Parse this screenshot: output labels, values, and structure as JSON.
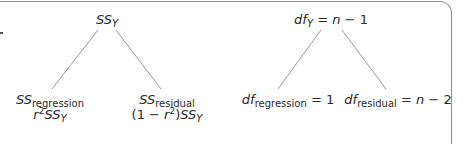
{
  "left_tree": {
    "root": {
      "var": "SS",
      "sub": "Y"
    },
    "left_child": {
      "var": "SS",
      "sub": "regression",
      "formula_prefix": "r",
      "formula_exp": "2",
      "formula_var": "SS",
      "formula_sub": "Y"
    },
    "right_child": {
      "var": "SS",
      "sub": "residual",
      "formula_open": "(1 − ",
      "formula_r": "r",
      "formula_exp": "2",
      "formula_close": ")",
      "formula_var": "SS",
      "formula_sub": "Y"
    }
  },
  "right_tree": {
    "root": {
      "var": "df",
      "sub": "Y",
      "eq": " = ",
      "n": "n",
      "rest": " − 1"
    },
    "left_child": {
      "var": "df",
      "sub": "regression",
      "eq": " = 1"
    },
    "right_child": {
      "var": "df",
      "sub": "residual",
      "eq": " = ",
      "n": "n",
      "rest": " − 2"
    }
  },
  "colors": {
    "line": "#9a9a9a",
    "frame": "#8e8e8e",
    "text": "#2a2a2a"
  }
}
